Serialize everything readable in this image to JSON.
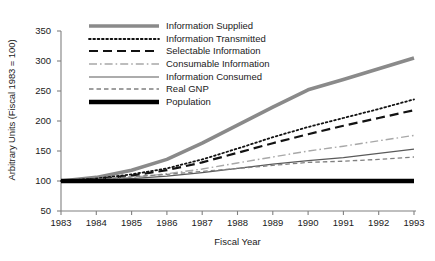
{
  "chart_data": {
    "type": "line",
    "title": "",
    "xlabel": "Fiscal Year",
    "ylabel": "Arbitrary Units (Fiscal 1983 = 100)",
    "x": [
      1983,
      1984,
      1985,
      1986,
      1987,
      1988,
      1989,
      1990,
      1991,
      1992,
      1993
    ],
    "xtick_labels": [
      "1983",
      "1984",
      "1985",
      "1986",
      "1987",
      "1988",
      "1989",
      "1990",
      "1991",
      "1992",
      "1993"
    ],
    "ytick_labels": [
      "50",
      "100",
      "150",
      "200",
      "250",
      "300",
      "350"
    ],
    "ylim": [
      50,
      350
    ],
    "ytick_step": 50,
    "xlim": [
      1983,
      1993
    ],
    "grid": false,
    "legend_position": "upper-left-inside",
    "series": [
      {
        "name": "Information Supplied",
        "style": "solid-thick",
        "color": "#8a8a8a",
        "width": 3.6,
        "values": [
          100,
          106,
          118,
          136,
          163,
          193,
          223,
          252,
          269,
          287,
          305
        ]
      },
      {
        "name": "Information Transmitted",
        "style": "dotted",
        "color": "#121212",
        "width": 1.8,
        "values": [
          100,
          104,
          111,
          121,
          136,
          154,
          173,
          190,
          205,
          220,
          236
        ]
      },
      {
        "name": "Selectable Information",
        "style": "long-dash",
        "color": "#121212",
        "width": 2.2,
        "values": [
          100,
          103,
          109,
          118,
          131,
          147,
          163,
          178,
          192,
          205,
          218
        ]
      },
      {
        "name": "Consumable Information",
        "style": "dash-dot",
        "color": "#a8a8a8",
        "width": 1.4,
        "values": [
          100,
          102,
          106,
          112,
          120,
          130,
          140,
          150,
          158,
          167,
          176
        ]
      },
      {
        "name": "Information Consumed",
        "style": "solid-thin",
        "color": "#5a5a5a",
        "width": 1.2,
        "values": [
          100,
          101,
          104,
          108,
          114,
          121,
          128,
          134,
          139,
          146,
          153
        ]
      },
      {
        "name": "Real GNP",
        "style": "short-dash",
        "color": "#808080",
        "width": 1.3,
        "values": [
          100,
          103,
          107,
          111,
          116,
          121,
          126,
          131,
          133,
          136,
          140
        ]
      },
      {
        "name": "Population",
        "style": "solid-extra-thick",
        "color": "#000000",
        "width": 4.4,
        "values": [
          100,
          100,
          100,
          100,
          100,
          100,
          100,
          100,
          100,
          100,
          100
        ]
      }
    ]
  },
  "axis": {
    "color": "#808080"
  }
}
